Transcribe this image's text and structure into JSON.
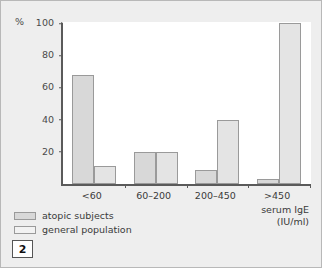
{
  "figure": {
    "number_label": "2",
    "y_axis_unit": "%"
  },
  "legend": {
    "items": [
      {
        "label": "atopic subjects",
        "key": "atopic",
        "color": "#d8d8d8"
      },
      {
        "label": "general population",
        "key": "general",
        "color": "#f2f2f2"
      }
    ]
  },
  "x_axis_title": {
    "line1": "serum IgE",
    "line2": "(IU/ml)"
  },
  "chart_data": {
    "type": "bar",
    "title": "",
    "subtitle": "",
    "xlabel": "serum IgE (IU/ml)",
    "ylabel": "%",
    "categories": [
      "<60",
      "60–200",
      "200–450",
      ">450"
    ],
    "series": [
      {
        "name": "atopic subjects",
        "values": [
          68,
          20,
          9,
          3
        ],
        "color": "#d8d8d8"
      },
      {
        "name": "general population",
        "values": [
          11,
          20,
          40,
          100
        ],
        "color": "#e4e4e4"
      }
    ],
    "ylim": [
      0,
      100
    ],
    "yticks": [
      20,
      40,
      60,
      80,
      100
    ],
    "ytick_labels": [
      "20",
      "40",
      "60",
      "80",
      "100"
    ],
    "grid": false,
    "legend_position": "below-left"
  }
}
